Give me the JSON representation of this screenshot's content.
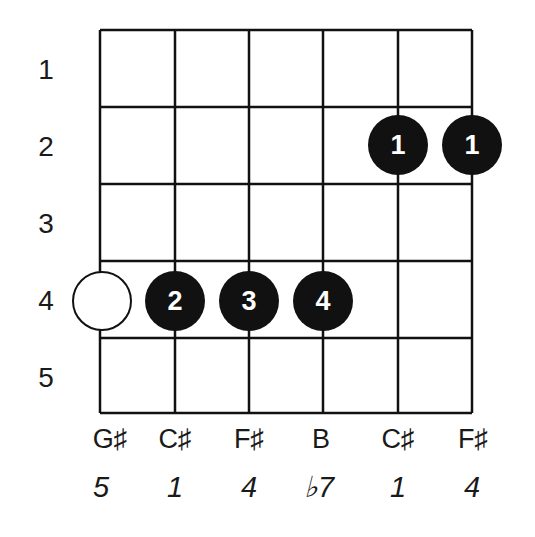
{
  "diagram": {
    "type": "guitar-chord-fretboard",
    "fret_labels": [
      "1",
      "2",
      "3",
      "4",
      "5"
    ],
    "strings": [
      {
        "note": "G♯",
        "interval": "5"
      },
      {
        "note": "C♯",
        "interval": "1"
      },
      {
        "note": "F♯",
        "interval": "4"
      },
      {
        "note": "B",
        "interval": "♭7"
      },
      {
        "note": "C♯",
        "interval": "1"
      },
      {
        "note": "F♯",
        "interval": "4"
      }
    ],
    "dots": [
      {
        "string": 1,
        "fret": 4,
        "finger": "",
        "style": "open"
      },
      {
        "string": 2,
        "fret": 4,
        "finger": "2",
        "style": "filled"
      },
      {
        "string": 3,
        "fret": 4,
        "finger": "3",
        "style": "filled"
      },
      {
        "string": 4,
        "fret": 4,
        "finger": "4",
        "style": "filled"
      },
      {
        "string": 5,
        "fret": 2,
        "finger": "1",
        "style": "filled"
      },
      {
        "string": 6,
        "fret": 2,
        "finger": "1",
        "style": "filled"
      }
    ],
    "colors": {
      "line": "#111111",
      "dot_fill": "#111111",
      "dot_text": "#ffffff",
      "background": "#ffffff"
    }
  }
}
